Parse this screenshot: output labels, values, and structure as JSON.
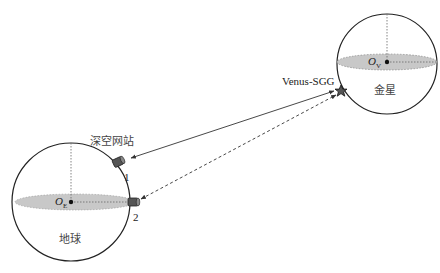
{
  "diagram": {
    "type": "Earth-Venus deep space link diagram",
    "earth": {
      "label": "地球",
      "origin_label": "O",
      "origin_subscript": "E",
      "fill_color": "#c8c8c8"
    },
    "venus": {
      "label": "金星",
      "origin_label": "O",
      "origin_subscript": "V",
      "fill_color": "#c8c8c8"
    },
    "satellite": {
      "label": "Venus-SGG",
      "color": "#555555"
    },
    "stations": {
      "label": "深空网站",
      "items": [
        {
          "id": "1",
          "label": "1"
        },
        {
          "id": "2",
          "label": "2"
        }
      ]
    },
    "links": [
      {
        "from": "station-1",
        "to": "Venus-SGG",
        "style": "solid",
        "direction": "two-way"
      },
      {
        "from": "station-2",
        "to": "Venus-SGG",
        "style": "dashed",
        "direction": "two-way"
      }
    ]
  }
}
